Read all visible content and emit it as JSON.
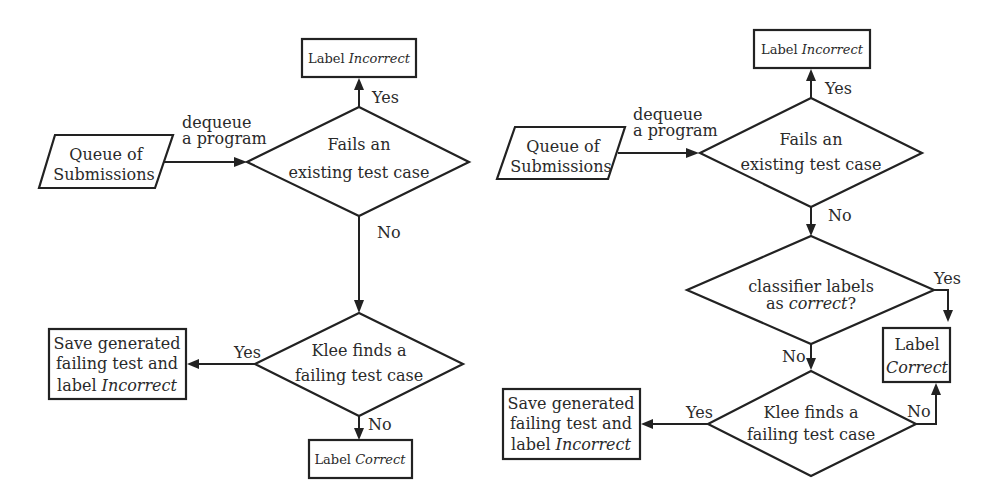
{
  "left_flow": {
    "queue": {
      "line1": "Queue of",
      "line2": "Submissions"
    },
    "edge_dequeue": {
      "line1": "dequeue",
      "line2": "a program"
    },
    "decision_fails": {
      "line1": "Fails an",
      "line2": "existing test case"
    },
    "edge_yes_top": "Yes",
    "label_incorrect_top": {
      "prefix": "Label ",
      "emph": "Incorrect"
    },
    "edge_no_down": "No",
    "decision_klee": {
      "line1": "Klee finds a",
      "line2": "failing test case"
    },
    "edge_yes_left": "Yes",
    "save_box": {
      "line1": "Save generated",
      "line2": "failing test and",
      "line3_prefix": "label ",
      "line3_emph": "Incorrect"
    },
    "edge_no_bottom": "No",
    "label_correct": {
      "prefix": "Label ",
      "emph": "Correct"
    }
  },
  "right_flow": {
    "queue": {
      "line1": "Queue of",
      "line2": "Submissions"
    },
    "edge_dequeue": {
      "line1": "dequeue",
      "line2": "a program"
    },
    "decision_fails": {
      "line1": "Fails an",
      "line2": "existing test case"
    },
    "edge_yes_top": "Yes",
    "label_incorrect_top": {
      "prefix": "Label ",
      "emph": "Incorrect"
    },
    "edge_no_down": "No",
    "decision_classifier": {
      "line1": "classifier labels",
      "line2_prefix": "as ",
      "line2_emph": "correct",
      "line2_suffix": "?"
    },
    "edge_yes_right": "Yes",
    "label_correct": {
      "line1": "Label",
      "line2": "Correct"
    },
    "edge_no_classifier": "No",
    "decision_klee": {
      "line1": "Klee finds a",
      "line2": "failing test case"
    },
    "edge_yes_left": "Yes",
    "edge_no_right": "No",
    "save_box": {
      "line1": "Save generated",
      "line2": "failing test and",
      "line3_prefix": "label ",
      "line3_emph": "Incorrect"
    }
  },
  "colors": {
    "stroke": "#222222",
    "background": "#ffffff"
  }
}
